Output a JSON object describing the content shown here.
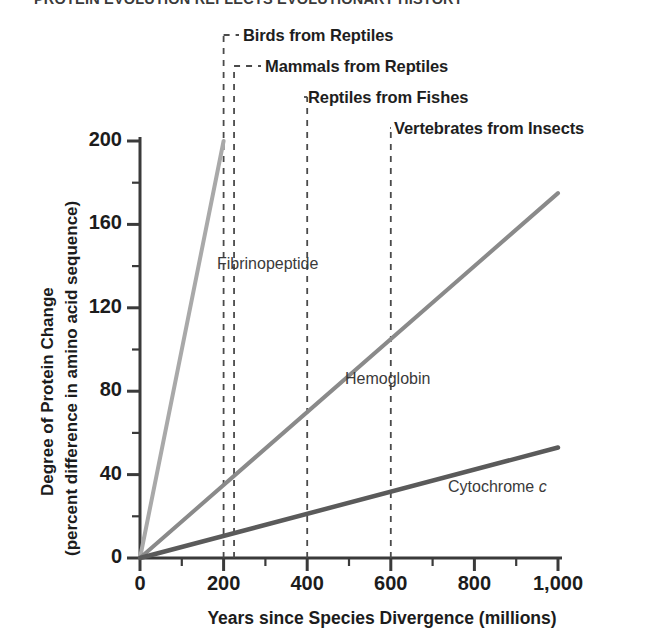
{
  "figure": {
    "cut_off_title": "PROTEIN EVOLUTION REFLECTS EVOLUTIONARY HISTORY"
  },
  "chart_data": {
    "type": "line",
    "title": "",
    "xlabel": "Years since Species Divergence (millions)",
    "ylabel": "Degree of Protein Change (percent difference in amino acid sequence)",
    "ylabel_line1": "Degree of Protein Change",
    "ylabel_line2": "(percent difference in amino acid sequence)",
    "xlim": [
      0,
      1000
    ],
    "ylim": [
      0,
      200
    ],
    "xticks": [
      0,
      200,
      400,
      600,
      800,
      1000
    ],
    "xticklabels": [
      "0",
      "200",
      "400",
      "600",
      "800",
      "1,000"
    ],
    "xminor_step": 100,
    "yticks": [
      0,
      40,
      80,
      120,
      160,
      200
    ],
    "yticklabels": [
      "0",
      "40",
      "80",
      "120",
      "160",
      "200"
    ],
    "yminor_step": 20,
    "grid": false,
    "legend_position": "inline-labels",
    "series": [
      {
        "name": "Fibrinopeptide",
        "color": "#a9a9a9",
        "x": [
          0,
          200
        ],
        "y": [
          0,
          200
        ],
        "label_x": 217,
        "label_y": 255
      },
      {
        "name": "Hemoglobin",
        "color": "#8a8a8a",
        "x": [
          0,
          1000
        ],
        "y": [
          0,
          175
        ],
        "label_x": 345,
        "label_y": 370
      },
      {
        "name": "Cytochrome c",
        "color": "#5a5a5a",
        "x": [
          0,
          1000
        ],
        "y": [
          0,
          53
        ],
        "label_x": 448,
        "label_y": 478,
        "italic_suffix": "c",
        "base_name": "Cytochrome "
      }
    ],
    "annotations": [
      {
        "text": "Birds from Reptiles",
        "x_value": 200,
        "label_x": 243,
        "label_y": 26,
        "leader_y": 35
      },
      {
        "text": "Mammals from Reptiles",
        "x_value": 225,
        "label_x": 265,
        "label_y": 57,
        "leader_y": 66
      },
      {
        "text": "Reptiles from Fishes",
        "x_value": 400,
        "label_x": 308,
        "label_y": 88,
        "leader_y": 97
      },
      {
        "text": "Vertebrates from Insects",
        "x_value": 600,
        "label_x": 394,
        "label_y": 119,
        "leader_y": 128
      }
    ]
  }
}
